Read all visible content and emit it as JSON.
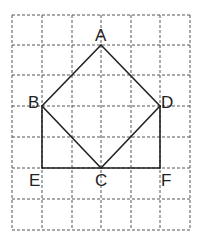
{
  "diagram": {
    "grid": {
      "x": [
        12,
        42,
        72,
        101,
        131,
        160,
        190
      ],
      "y": [
        15,
        45,
        75,
        106,
        137,
        168,
        199,
        230
      ],
      "style": "dashed",
      "color": "#555555"
    },
    "points": {
      "A": {
        "label": "A",
        "x": 101,
        "y": 45
      },
      "B": {
        "label": "B",
        "x": 42,
        "y": 106
      },
      "C": {
        "label": "C",
        "x": 101,
        "y": 168
      },
      "D": {
        "label": "D",
        "x": 160,
        "y": 106
      },
      "E": {
        "label": "E",
        "x": 42,
        "y": 168
      },
      "F": {
        "label": "F",
        "x": 160,
        "y": 168
      }
    },
    "segments": [
      [
        "A",
        "B"
      ],
      [
        "A",
        "D"
      ],
      [
        "B",
        "C"
      ],
      [
        "D",
        "C"
      ],
      [
        "B",
        "E"
      ],
      [
        "D",
        "F"
      ],
      [
        "E",
        "F"
      ]
    ],
    "labels": {
      "A": "A",
      "B": "B",
      "C": "C",
      "D": "D",
      "E": "E",
      "F": "F"
    }
  }
}
